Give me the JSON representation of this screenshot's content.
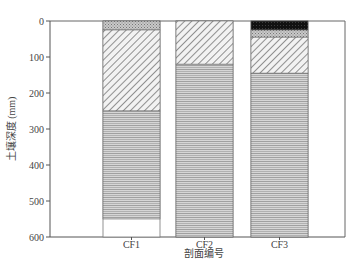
{
  "chart_data": {
    "type": "bar",
    "subtype": "stacked-layer-profile",
    "title": "",
    "xlabel": "剖面编号",
    "ylabel": "土壤深度 (mm)",
    "ylim": [
      0,
      600
    ],
    "y_inverted": true,
    "yticks": [
      0,
      100,
      200,
      300,
      400,
      500,
      600
    ],
    "categories": [
      "CF1",
      "CF2",
      "CF3"
    ],
    "grid": false,
    "legend": "none",
    "profiles": [
      {
        "name": "CF1",
        "layers": [
          {
            "from": 0,
            "to": 25,
            "pattern": "fine-dots"
          },
          {
            "from": 25,
            "to": 250,
            "pattern": "diagonal-hatch"
          },
          {
            "from": 250,
            "to": 550,
            "pattern": "zigzag"
          }
        ]
      },
      {
        "name": "CF2",
        "layers": [
          {
            "from": 0,
            "to": 120,
            "pattern": "diagonal-hatch"
          },
          {
            "from": 120,
            "to": 600,
            "pattern": "zigzag"
          }
        ]
      },
      {
        "name": "CF3",
        "layers": [
          {
            "from": 0,
            "to": 25,
            "pattern": "black"
          },
          {
            "from": 25,
            "to": 45,
            "pattern": "fine-dots"
          },
          {
            "from": 45,
            "to": 145,
            "pattern": "diagonal-hatch"
          },
          {
            "from": 145,
            "to": 600,
            "pattern": "zigzag"
          }
        ]
      }
    ]
  },
  "axis": {
    "y_ticks": [
      "0",
      "100",
      "200",
      "300",
      "400",
      "500",
      "600"
    ],
    "x_ticks": [
      "CF1",
      "CF2",
      "CF3"
    ],
    "x_label": "剖面编号",
    "y_label": "土壤深度 (mm)"
  }
}
